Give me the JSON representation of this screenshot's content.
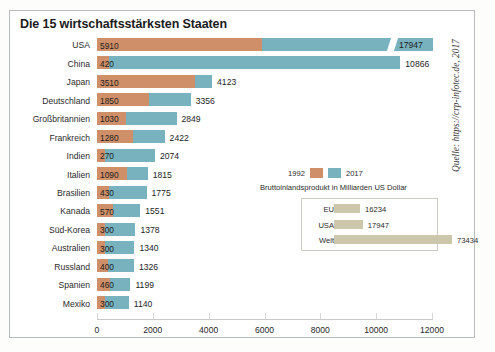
{
  "title": "Die 15 wirtschaftsstärksten Staaten",
  "source": "Quelle: https://crp-infotec.de, 2017",
  "legend": {
    "label_1992": "1992",
    "label_2017": "2017",
    "subtitle": "Bruttoinlandsprodukt in Milliarden US Dollar",
    "color_1992": "#cf8f68",
    "color_2017": "#79b2bf"
  },
  "inset": {
    "rows": [
      {
        "label": "EU",
        "value": 16234,
        "value_text": "16234"
      },
      {
        "label": "USA",
        "value": 17947,
        "value_text": "17947"
      },
      {
        "label": "Welt",
        "value": 73434,
        "value_text": "73434"
      }
    ],
    "bar_color": "#ccc6ab"
  },
  "axis": {
    "ticks": [
      "0",
      "2000",
      "4000",
      "6000",
      "8000",
      "10000",
      "12000"
    ],
    "min": 0,
    "max": 12000,
    "step": 2000
  },
  "chart_data": {
    "type": "bar",
    "orientation": "horizontal",
    "title": "Die 15 wirtschaftsstärksten Staaten",
    "subtitle": "Bruttoinlandsprodukt in Milliarden US Dollar",
    "xlabel": "Bruttoinlandsprodukt in Milliarden US Dollar",
    "ylabel": "",
    "xlim": [
      0,
      12000
    ],
    "xticks": [
      0,
      2000,
      4000,
      6000,
      8000,
      10000,
      12000
    ],
    "grid": false,
    "legend_position": "middle-right",
    "categories": [
      "USA",
      "China",
      "Japan",
      "Deutschland",
      "Großbritannien",
      "Frankreich",
      "Indien",
      "Italien",
      "Brasilien",
      "Kanada",
      "Süd-Korea",
      "Australien",
      "Russland",
      "Spanien",
      "Mexiko"
    ],
    "series": [
      {
        "name": "1992",
        "color": "#cf8f68",
        "values": [
          5910,
          420,
          3510,
          1850,
          1030,
          1280,
          270,
          1090,
          430,
          570,
          300,
          300,
          400,
          460,
          300
        ]
      },
      {
        "name": "2017",
        "color": "#79b2bf",
        "values": [
          17947,
          10866,
          4123,
          3356,
          2849,
          2422,
          2074,
          1815,
          1775,
          1551,
          1378,
          1340,
          1326,
          1199,
          1140
        ]
      }
    ],
    "annotations": [
      {
        "text": "USA 2017 bar extends past axis maximum; value label 17947 shown inside bar end"
      },
      {
        "label": "EU",
        "value": 16234
      },
      {
        "label": "USA",
        "value": 17947
      },
      {
        "label": "Welt",
        "value": 73434
      }
    ],
    "source": "Quelle: https://crp-infotec.de, 2017"
  },
  "rows": [
    {
      "country": "USA",
      "v1992": "5910",
      "v2017": "17947"
    },
    {
      "country": "China",
      "v1992": "420",
      "v2017": "10866"
    },
    {
      "country": "Japan",
      "v1992": "3510",
      "v2017": "4123"
    },
    {
      "country": "Deutschland",
      "v1992": "1850",
      "v2017": "3356"
    },
    {
      "country": "Großbritannien",
      "v1992": "1030",
      "v2017": "2849"
    },
    {
      "country": "Frankreich",
      "v1992": "1280",
      "v2017": "2422"
    },
    {
      "country": "Indien",
      "v1992": "270",
      "v2017": "2074"
    },
    {
      "country": "Italien",
      "v1992": "1090",
      "v2017": "1815"
    },
    {
      "country": "Brasilien",
      "v1992": "430",
      "v2017": "1775"
    },
    {
      "country": "Kanada",
      "v1992": "570",
      "v2017": "1551"
    },
    {
      "country": "Süd-Korea",
      "v1992": "300",
      "v2017": "1378"
    },
    {
      "country": "Australien",
      "v1992": "300",
      "v2017": "1340"
    },
    {
      "country": "Russland",
      "v1992": "400",
      "v2017": "1326"
    },
    {
      "country": "Spanien",
      "v1992": "460",
      "v2017": "1199"
    },
    {
      "country": "Mexiko",
      "v1992": "300",
      "v2017": "1140"
    }
  ]
}
